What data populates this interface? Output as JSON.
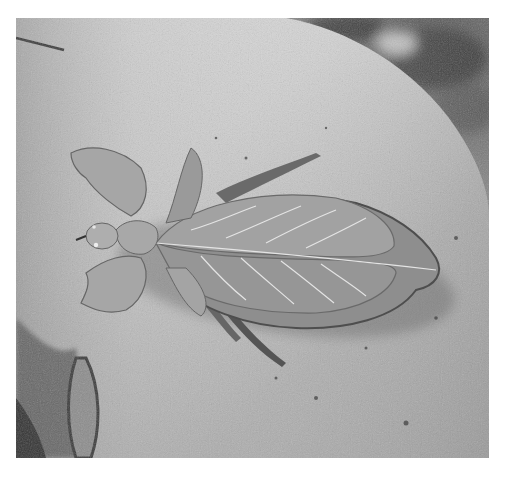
{
  "image": {
    "subject": "leaf insect on rock",
    "palette": {
      "border": "#ffffff",
      "rock_light": "#dedede",
      "rock_mid": "#a8a8a8",
      "rock_dark": "#6e6e6e",
      "background_dark": "#3a3a3a",
      "insect_body": "#9c9c9c",
      "insect_vein": "#e6e6e6",
      "insect_edge": "#5a5a5a"
    }
  }
}
